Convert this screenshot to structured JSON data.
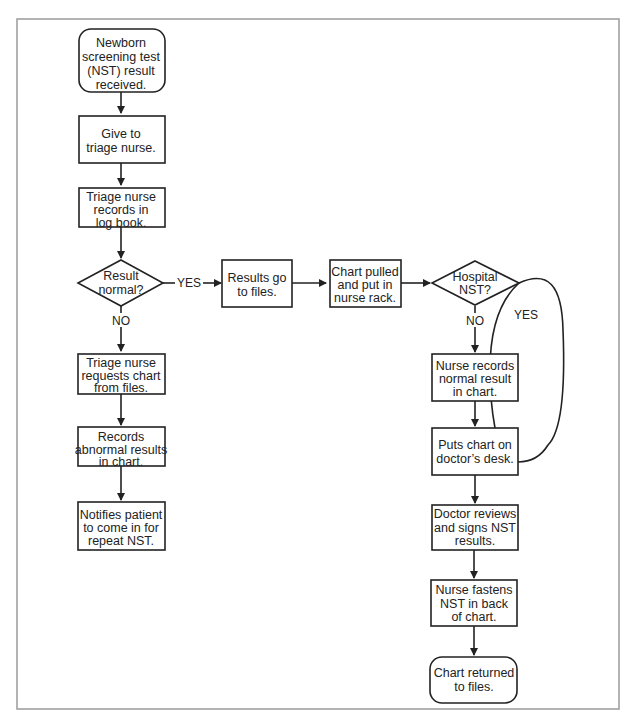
{
  "nodes": {
    "n1": {
      "shape": "rounded",
      "lines": [
        "Newborn",
        "screening test",
        "(NST) result",
        "received."
      ]
    },
    "n2": {
      "shape": "rect",
      "lines": [
        "Give to",
        "triage nurse."
      ]
    },
    "n3": {
      "shape": "rect",
      "lines": [
        "Triage nurse",
        "records in",
        "log book."
      ]
    },
    "d1": {
      "shape": "diamond",
      "lines": [
        "Result",
        "normal?"
      ]
    },
    "n4": {
      "shape": "rect",
      "lines": [
        "Results go",
        "to files."
      ]
    },
    "n5": {
      "shape": "rect",
      "lines": [
        "Chart pulled",
        "and put in",
        "nurse rack."
      ]
    },
    "d2": {
      "shape": "diamond",
      "lines": [
        "Hospital",
        "NST?"
      ]
    },
    "n6": {
      "shape": "rect",
      "lines": [
        "Triage nurse",
        "requests chart",
        "from files."
      ]
    },
    "n7": {
      "shape": "rect",
      "lines": [
        "Records",
        "abnormal results",
        "in chart."
      ]
    },
    "n8": {
      "shape": "rect",
      "lines": [
        "Notifies patient",
        "to come in for",
        "repeat NST."
      ]
    },
    "n9": {
      "shape": "rect",
      "lines": [
        "Nurse records",
        "normal result",
        "in chart."
      ]
    },
    "n10": {
      "shape": "rect",
      "lines": [
        "Puts chart on",
        "doctor’s desk."
      ]
    },
    "n11": {
      "shape": "rect",
      "lines": [
        "Doctor reviews",
        "and signs NST",
        "results."
      ]
    },
    "n12": {
      "shape": "rect",
      "lines": [
        "Nurse fastens",
        "NST in back",
        "of chart."
      ]
    },
    "n13": {
      "shape": "rounded",
      "lines": [
        "Chart returned",
        "to files."
      ]
    }
  },
  "edge_labels": {
    "d1_yes": "YES",
    "d1_no": "NO",
    "d2_no": "NO",
    "d2_yes": "YES"
  },
  "colors": {
    "stroke": "#222222",
    "frame": "#9a9a9a",
    "background": "#ffffff"
  }
}
